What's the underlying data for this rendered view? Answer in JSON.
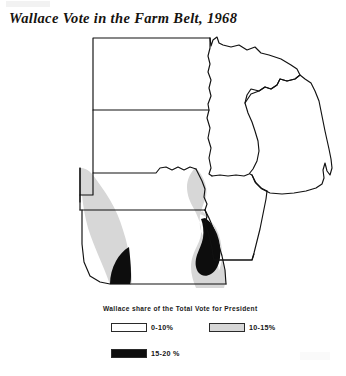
{
  "title": "Wallace Vote in the Farm Belt, 1968",
  "legend": {
    "title": "Wallace share of the Total Vote for President",
    "entries": [
      {
        "label": "0-10%",
        "color": "#ffffff",
        "name": "legend-swatch-0-10"
      },
      {
        "label": "10-15%",
        "color": "#d7d7d7",
        "name": "legend-swatch-10-15"
      },
      {
        "label": "15-20 %",
        "color": "#0d0d0d",
        "name": "legend-swatch-15-20"
      }
    ]
  },
  "colors": {
    "outline": "#111111",
    "low": "#ffffff",
    "mid": "#d7d7d7",
    "high": "#0d0d0d",
    "background": "#ffffff"
  },
  "map": {
    "region": "Farm Belt",
    "year": "1968",
    "states": [
      {
        "name": "North Dakota",
        "class": "0-10%"
      },
      {
        "name": "South Dakota",
        "class": "0-10%"
      },
      {
        "name": "Minnesota",
        "class": "0-10%"
      },
      {
        "name": "Wisconsin",
        "class": "0-10%"
      },
      {
        "name": "Nebraska",
        "class": "0-10% with 10-15% band in west and east"
      },
      {
        "name": "Iowa",
        "class": "0-10%"
      },
      {
        "name": "Kansas",
        "class": "0-10% with 10-15% bands west and east, 15-20% patches southwest corner and east"
      },
      {
        "name": "Missouri",
        "class": "10-15% along western border, 15-20% patch at Kansas border"
      }
    ]
  }
}
